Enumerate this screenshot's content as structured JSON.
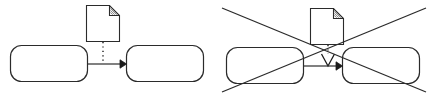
{
  "image": {
    "width": 432,
    "height": 98,
    "background_color": "#ffffff",
    "line_color": "#2b2b2b",
    "accent_color": "#1a1a1a",
    "type": "line-diagram",
    "description": "Two side-by-side notation variants: a correct example on the left and the same example on the right struck through with a large X."
  },
  "panels": [
    {
      "id": "correct-example",
      "name": "left-panel",
      "marked_invalid": false,
      "x": 0,
      "y": 0,
      "width": 216,
      "height": 98
    },
    {
      "id": "incorrect-example",
      "name": "right-panel",
      "marked_invalid": true,
      "x": 216,
      "y": 0,
      "width": 216,
      "height": 98
    }
  ],
  "left_panel": {
    "label": "",
    "document_icon": {
      "name": "document-data-object-icon",
      "x": 86,
      "y": 5,
      "width": 34,
      "height": 37,
      "folded_corner": "top-right",
      "fold_size": 11,
      "fold_hatching": true
    },
    "task_left": {
      "name": "rounded-task-left",
      "label": "",
      "x": 10,
      "y": 45,
      "width": 78,
      "height": 37,
      "corner_radius": 11
    },
    "task_right": {
      "name": "rounded-task-right",
      "label": "",
      "x": 126,
      "y": 45,
      "width": 78,
      "height": 37,
      "corner_radius": 11
    },
    "sequence_flow": {
      "name": "sequence-flow-arrow",
      "from_x": 88,
      "to_x": 126,
      "y": 64,
      "arrowhead": "solid-filled-triangle"
    },
    "association": {
      "name": "dotted-association-line",
      "x": 103,
      "from_y": 42,
      "to_y": 64,
      "style": "dotted",
      "arrowhead": "none"
    }
  },
  "right_panel": {
    "label": "",
    "document_icon": {
      "name": "document-data-object-icon",
      "x": 310,
      "y": 8,
      "width": 34,
      "height": 37,
      "folded_corner": "top-right",
      "fold_size": 11,
      "fold_hatching": true
    },
    "task_left": {
      "name": "rounded-task-left",
      "label": "",
      "x": 226,
      "y": 47,
      "width": 78,
      "height": 37,
      "corner_radius": 11
    },
    "task_right": {
      "name": "rounded-task-right",
      "label": "",
      "x": 342,
      "y": 47,
      "width": 78,
      "height": 37,
      "corner_radius": 11
    },
    "sequence_flow": {
      "name": "sequence-flow-arrow",
      "from_x": 304,
      "to_x": 342,
      "y": 66,
      "arrowhead": "solid-filled-triangle"
    },
    "association": {
      "name": "dotted-association-line",
      "x": 328,
      "from_y": 45,
      "to_y": 66,
      "style": "dotted",
      "arrowhead": "open-hollow-triangle"
    },
    "invalid_cross": {
      "name": "invalid-cross-mark",
      "stroke_width": 1.3,
      "line_a": {
        "x1": 222,
        "y1": 8,
        "x2": 426,
        "y2": 92
      },
      "line_b": {
        "x1": 222,
        "y1": 92,
        "x2": 426,
        "y2": 8
      }
    }
  }
}
